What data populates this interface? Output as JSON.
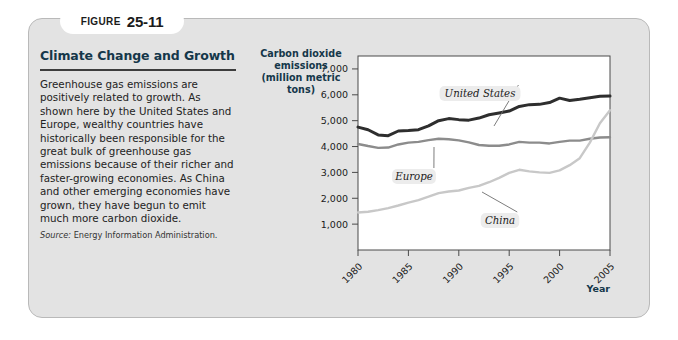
{
  "figure": {
    "badge_word": "FIGURE",
    "badge_number": "25-11",
    "title": "Climate Change and Growth",
    "body": "Greenhouse gas emissions are positively related to growth. As shown here by the United States and Europe, wealthy countries have historically been responsible for the great bulk of greenhouse gas emissions because of their richer and faster-growing economies. As China and other emerging economies have grown, they have begun to emit much more carbon dioxide.",
    "source_label": "Source:",
    "source_text": "Energy Information Administration."
  },
  "colors": {
    "panel_background": "#e3e3e3",
    "title_blue": "#15374a",
    "united_states_line": "#2e2e2e",
    "europe_line": "#8c8c8c",
    "china_line": "#c8c8c8",
    "plot_background": "#ffffff",
    "axis": "#4a4a4a"
  },
  "chart_data": {
    "type": "line",
    "title": "",
    "ylabel": "Carbon dioxide emissions (million metric tons)",
    "ylabel_lines": [
      "Carbon dioxide",
      "emissions",
      "(million metric tons)"
    ],
    "xlabel": "Year",
    "xlim": [
      1980,
      2005
    ],
    "ylim": [
      0,
      7500
    ],
    "yticks": [
      1000,
      2000,
      3000,
      4000,
      5000,
      6000,
      7000
    ],
    "ytick_labels": [
      "1,000",
      "2,000",
      "3,000",
      "4,000",
      "5,000",
      "6,000",
      "7,000"
    ],
    "xticks": [
      1980,
      1985,
      1990,
      1995,
      2000,
      2005
    ],
    "xtick_labels": [
      "1980",
      "1985",
      "1990",
      "1995",
      "2000",
      "2005"
    ],
    "grid": false,
    "legend": "inline-annotations",
    "x": [
      1980,
      1981,
      1982,
      1983,
      1984,
      1985,
      1986,
      1987,
      1988,
      1989,
      1990,
      1991,
      1992,
      1993,
      1994,
      1995,
      1996,
      1997,
      1998,
      1999,
      2000,
      2001,
      2002,
      2003,
      2004,
      2005
    ],
    "series": [
      {
        "name": "United States",
        "color": "#2e2e2e",
        "values": [
          4750,
          4650,
          4450,
          4420,
          4600,
          4620,
          4650,
          4800,
          5000,
          5080,
          5040,
          5020,
          5100,
          5230,
          5300,
          5370,
          5550,
          5620,
          5630,
          5700,
          5870,
          5780,
          5830,
          5890,
          5940,
          5950
        ]
      },
      {
        "name": "Europe",
        "color": "#8c8c8c",
        "values": [
          4100,
          4020,
          3950,
          3960,
          4080,
          4150,
          4180,
          4250,
          4300,
          4280,
          4240,
          4160,
          4060,
          4030,
          4030,
          4080,
          4180,
          4150,
          4150,
          4120,
          4180,
          4230,
          4230,
          4300,
          4350,
          4360
        ]
      },
      {
        "name": "China",
        "color": "#c8c8c8",
        "values": [
          1450,
          1480,
          1540,
          1620,
          1720,
          1830,
          1930,
          2060,
          2200,
          2260,
          2300,
          2400,
          2480,
          2620,
          2790,
          2980,
          3100,
          3040,
          3000,
          2980,
          3080,
          3280,
          3550,
          4150,
          4900,
          5400
        ]
      }
    ],
    "annotations": [
      {
        "text": "United States",
        "series": "United States"
      },
      {
        "text": "Europe",
        "series": "Europe"
      },
      {
        "text": "China",
        "series": "China"
      }
    ]
  }
}
